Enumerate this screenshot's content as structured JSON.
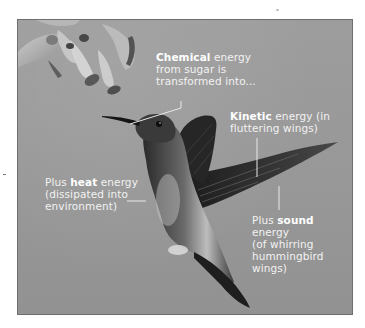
{
  "figure": {
    "background_color": "#9a9a9a",
    "label_color": "#f2f2f2",
    "leader_line_color": "#e8e8e8"
  },
  "labels": {
    "chemical": {
      "bold": "Chemical",
      "line1_rest": " energy",
      "line2": "from sugar is",
      "line3": "transformed into..."
    },
    "kinetic": {
      "bold": "Kinetic",
      "line1_rest": " energy (in",
      "line2": "fluttering wings)"
    },
    "heat": {
      "prefix": "Plus ",
      "bold": "heat",
      "line1_rest": " energy",
      "line2": "(dissipated into",
      "line3": "environment)"
    },
    "sound": {
      "prefix": "Plus ",
      "bold": "sound",
      "line2": "energy",
      "line3": "(of whirring",
      "line4": "hummingbird",
      "line5": "wings)"
    }
  }
}
